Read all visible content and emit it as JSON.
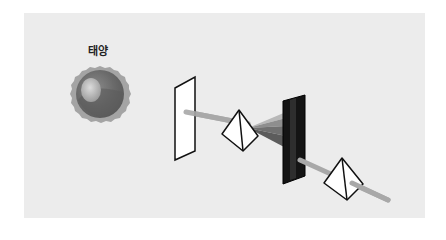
{
  "diagram": {
    "sun_label": "태양",
    "elements": [
      {
        "name": "sun",
        "type": "circle"
      },
      {
        "name": "slit-screen",
        "type": "white-card"
      },
      {
        "name": "prism-1",
        "type": "triangular-prism"
      },
      {
        "name": "spectrum-fan",
        "type": "dispersed-light"
      },
      {
        "name": "dark-screen-with-slit",
        "type": "black-card"
      },
      {
        "name": "prism-2",
        "type": "triangular-prism"
      },
      {
        "name": "light-beam",
        "type": "ray"
      }
    ],
    "colors": {
      "background": "#ececec",
      "beam": "#a8a8a8",
      "sun_outer": "#9a9a9a",
      "sun_inner": "#6e6e6e",
      "dark_screen": "#141414"
    }
  }
}
